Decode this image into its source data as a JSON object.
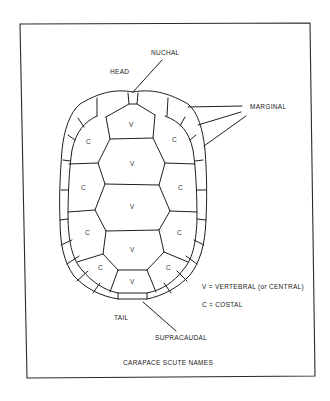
{
  "figure": {
    "title": "CARAPACE SCUTE NAMES",
    "labels": {
      "nuchal": "NUCHAL",
      "head": "HEAD",
      "marginal": "MARGINAL",
      "tail": "TAIL",
      "supracaudal": "SUPRACAUDAL"
    },
    "legend": [
      {
        "key": "V",
        "text": "V = VERTEBRAL (or CENTRAL)"
      },
      {
        "key": "C",
        "text": "C = COSTAL"
      }
    ],
    "scutes": {
      "vertebral": [
        "V",
        "V",
        "V",
        "V",
        "V"
      ],
      "costal_left": [
        "C",
        "C",
        "C",
        "C"
      ],
      "costal_right": [
        "C",
        "C",
        "C",
        "C"
      ]
    },
    "colors": {
      "line": "#1e1e1e",
      "background": "#ffffff"
    }
  }
}
